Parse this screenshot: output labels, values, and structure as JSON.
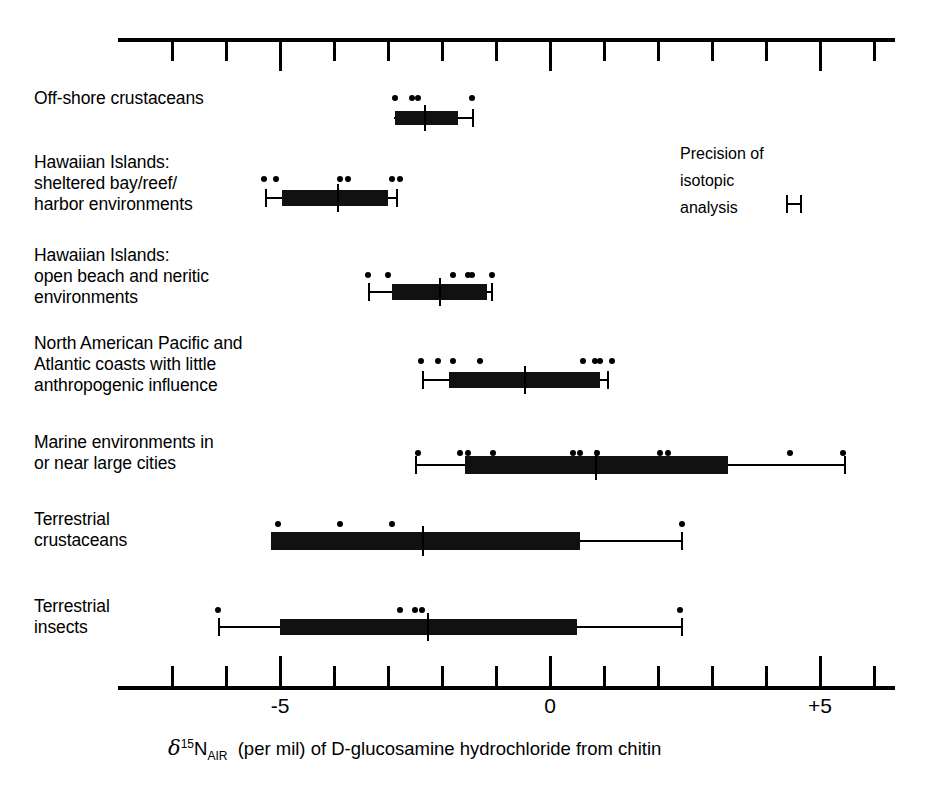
{
  "chart_data": {
    "type": "box",
    "title": "",
    "xlabel": "δ15NAIR (per mil) of D-glucosamine hydrochloride from chitin",
    "xlabel_parts": {
      "delta": "δ",
      "superscript": "15",
      "element": "N",
      "subscript": "AIR",
      "rest": "(per mil) of D-glucosamine hydrochloride from chitin"
    },
    "ylabel": "",
    "xlim": [
      -8.0,
      6.4
    ],
    "xticks": [
      -7,
      -6,
      -5,
      -4,
      -3,
      -2,
      -1,
      0,
      1,
      2,
      3,
      4,
      5,
      6
    ],
    "xtick_major": [
      -5,
      0,
      5
    ],
    "xticklabels": [
      {
        "value": -5,
        "label": "-5"
      },
      {
        "value": 0,
        "label": "0"
      },
      {
        "value": 5,
        "label": "+5"
      }
    ],
    "grid": false,
    "legend_position": "upper-right",
    "categories": [
      "Off-shore crustaceans",
      "Hawaiian Islands:\nsheltered bay/reef/\nharbor environments",
      "Hawaiian Islands:\nopen beach and neritic\nenvironments",
      "North American Pacific and\nAtlantic coasts with little\nanthropogenic influence",
      "Marine environments in\nor near large cities",
      "Terrestrial\ncrustaceans",
      "Terrestrial\ninsects"
    ],
    "boxes": [
      {
        "name": "Off-shore crustaceans",
        "whisker_low": -2.89,
        "q1": -2.87,
        "median": -2.31,
        "q3": -1.7,
        "whisker_high": -1.43,
        "points": [
          -2.87,
          -2.56,
          -2.44,
          -1.44
        ]
      },
      {
        "name": "Hawaiian Islands: sheltered bay/reef/harbor environments",
        "whisker_low": -5.26,
        "q1": -4.96,
        "median": -3.93,
        "q3": -3.0,
        "whisker_high": -2.83,
        "points": [
          -5.3,
          -5.07,
          -3.89,
          -3.74,
          -2.93,
          -2.78
        ]
      },
      {
        "name": "Hawaiian Islands: open beach and neritic environments",
        "whisker_low": -3.35,
        "q1": -2.93,
        "median": -2.04,
        "q3": -1.17,
        "whisker_high": -1.07,
        "points": [
          -3.37,
          -3.0,
          -1.8,
          -1.52,
          -1.44,
          -1.07
        ]
      },
      {
        "name": "North American Pacific and Atlantic coasts with little anthropogenic influence",
        "whisker_low": -2.35,
        "q1": -1.87,
        "median": -0.46,
        "q3": 0.93,
        "whisker_high": 1.07,
        "points": [
          -2.39,
          -2.07,
          -1.8,
          -1.3,
          0.61,
          0.83,
          0.93,
          1.15
        ]
      },
      {
        "name": "Marine environments in or near large cities",
        "whisker_low": -2.48,
        "q1": -1.57,
        "median": 0.85,
        "q3": 3.3,
        "whisker_high": 5.46,
        "points": [
          -2.44,
          -1.67,
          -1.52,
          -1.06,
          0.43,
          0.56,
          0.87,
          2.04,
          2.19,
          4.44,
          5.43
        ]
      },
      {
        "name": "Terrestrial crustaceans",
        "whisker_low": -5.17,
        "q1": -5.17,
        "median": -2.35,
        "q3": 0.56,
        "whisker_high": 2.44,
        "points": [
          -5.04,
          -3.89,
          -2.93,
          2.44
        ]
      },
      {
        "name": "Terrestrial insects",
        "whisker_low": -6.13,
        "q1": -5.0,
        "median": -2.26,
        "q3": 0.5,
        "whisker_high": 2.44,
        "points": [
          -6.15,
          -2.78,
          -2.5,
          -2.37,
          2.41
        ]
      }
    ],
    "annotations": [
      {
        "name": "precision-of-isotopic-analysis",
        "lines": [
          "Precision of",
          "isotopic",
          "analysis"
        ],
        "symbol": "error-bar"
      }
    ]
  },
  "colors": {
    "ink": "#000000",
    "box_fill": "#111111",
    "background": "#ffffff"
  }
}
